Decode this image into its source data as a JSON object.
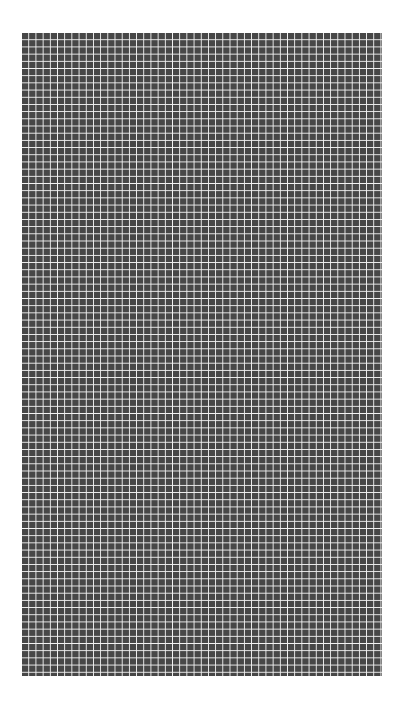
{
  "grid": {
    "columns": 50,
    "rows": 89,
    "cell_color": "#474747",
    "gap_color": "#f4f4f4",
    "background_color": "#ffffff"
  }
}
